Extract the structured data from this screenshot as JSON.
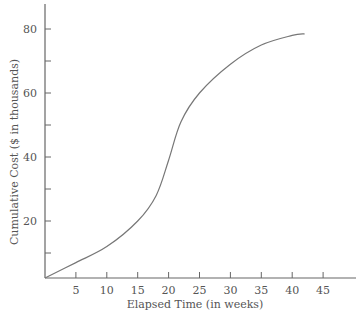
{
  "chart_data": {
    "type": "line",
    "title": "",
    "xlabel": "Elapsed Time (in weeks)",
    "ylabel": "Cumulative Cost ($ in thousands)",
    "xlim": [
      0,
      47
    ],
    "ylim": [
      0,
      88
    ],
    "x_ticks": [
      5,
      10,
      15,
      20,
      25,
      30,
      35,
      40,
      45
    ],
    "y_ticks_labeled": [
      20,
      40,
      60,
      80
    ],
    "y_ticks_minor": [
      10,
      30,
      50,
      70
    ],
    "grid": false,
    "legend": null,
    "series": [
      {
        "name": "Cumulative Cost",
        "x": [
          0,
          5,
          10,
          15,
          18,
          20,
          22,
          25,
          30,
          35,
          40,
          42
        ],
        "values": [
          2,
          7,
          12,
          20,
          28,
          39,
          51,
          60,
          69,
          75,
          78,
          78.5
        ]
      }
    ]
  },
  "colors": {
    "axis": "#666666",
    "line": "#777777",
    "text": "#555555"
  }
}
